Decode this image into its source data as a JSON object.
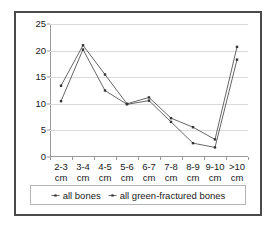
{
  "chart_data": {
    "type": "line",
    "title": "",
    "xlabel": "",
    "ylabel": "",
    "categories": [
      "2-3 cm",
      "3-4 cm",
      "4-5 cm",
      "5-6 cm",
      "6-7 cm",
      "7-8 cm",
      "8-9 cm",
      "9-10 cm",
      ">10 cm"
    ],
    "category_lines": [
      [
        "2-3",
        "cm"
      ],
      [
        "3-4",
        "cm"
      ],
      [
        "4-5",
        "cm"
      ],
      [
        "5-6",
        "cm"
      ],
      [
        "6-7",
        "cm"
      ],
      [
        "7-8",
        "cm"
      ],
      [
        "8-9",
        "cm"
      ],
      [
        "9-10",
        "cm"
      ],
      [
        ">10",
        "cm"
      ]
    ],
    "ylim": [
      0,
      25
    ],
    "yticks": [
      0,
      5,
      10,
      15,
      20,
      25
    ],
    "grid": true,
    "legend_position": "bottom",
    "series": [
      {
        "name": "all bones",
        "color": "#555555",
        "values": [
          13.4,
          21.0,
          15.5,
          10.0,
          11.2,
          7.3,
          5.6,
          3.3,
          20.7
        ]
      },
      {
        "name": "all green-fractured bones",
        "color": "#555555",
        "values": [
          10.5,
          20.2,
          12.5,
          9.9,
          10.6,
          6.6,
          2.6,
          1.8,
          18.3
        ]
      }
    ]
  },
  "legend": {
    "items": [
      {
        "label": "all bones",
        "marker": "plus-marker-icon"
      },
      {
        "label": "all green-fractured bones",
        "marker": "plus-marker-icon"
      }
    ]
  }
}
